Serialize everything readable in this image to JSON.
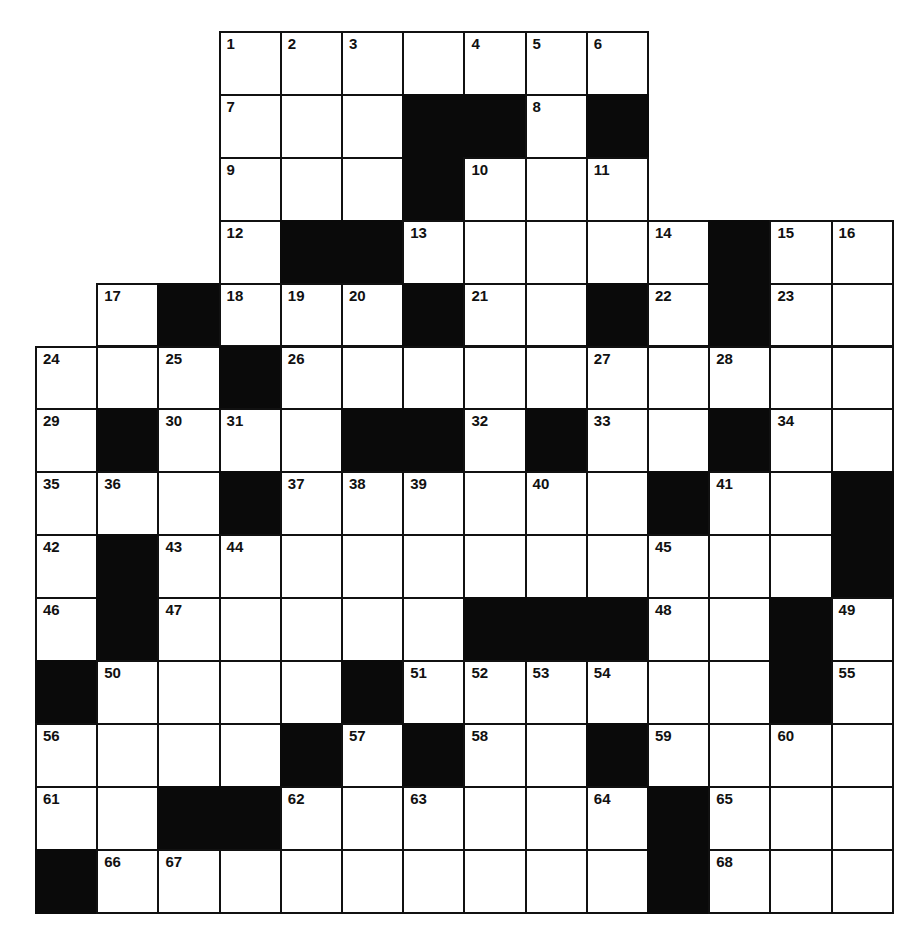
{
  "puzzle": {
    "type": "crossword",
    "grid_origin": {
      "left": 36,
      "top": 32
    },
    "cell_size": {
      "width": 61.2,
      "height": 62.9
    },
    "rows": 14,
    "cols": 14,
    "colors": {
      "block": "#0a0a0a",
      "line": "#111111",
      "cell": "#ffffff"
    },
    "legend": {
      "outside": ".",
      "block": "#",
      "empty": "_"
    },
    "grid": [
      [
        ".",
        ".",
        ".",
        "1",
        "2",
        "3",
        "_",
        "4",
        "5",
        "6",
        ".",
        ".",
        ".",
        "."
      ],
      [
        ".",
        ".",
        ".",
        "7",
        "_",
        "_",
        "#",
        "#",
        "8",
        "#",
        ".",
        ".",
        ".",
        "."
      ],
      [
        ".",
        ".",
        ".",
        "9",
        "_",
        "_",
        "#",
        "10",
        "_",
        "11",
        ".",
        ".",
        ".",
        "."
      ],
      [
        ".",
        ".",
        ".",
        "12",
        "#",
        "#",
        "13",
        "_",
        "_",
        "_",
        "14",
        "#",
        "15",
        "16"
      ],
      [
        ".",
        "17",
        "#",
        "18",
        "19",
        "20",
        "#",
        "21",
        "_",
        "#",
        "22",
        "#",
        "23",
        "_"
      ],
      [
        "24",
        "_",
        "25",
        "#",
        "26",
        "_",
        "_",
        "_",
        "_",
        "27",
        "_",
        "28",
        "_",
        "_"
      ],
      [
        "29",
        "#",
        "30",
        "31",
        "_",
        "#",
        "#",
        "32",
        "#",
        "33",
        "_",
        "#",
        "34",
        "_"
      ],
      [
        "35",
        "36",
        "_",
        "#",
        "37",
        "38",
        "39",
        "_",
        "40",
        "_",
        "#",
        "41",
        "_",
        "#"
      ],
      [
        "42",
        "#",
        "43",
        "44",
        "_",
        "_",
        "_",
        "_",
        "_",
        "_",
        "45",
        "_",
        "_",
        "#"
      ],
      [
        "46",
        "#",
        "47",
        "_",
        "_",
        "_",
        "_",
        "#",
        "#",
        "#",
        "48",
        "_",
        "#",
        "49"
      ],
      [
        "#",
        "50",
        "_",
        "_",
        "_",
        "#",
        "51",
        "52",
        "53",
        "54",
        "_",
        "_",
        "#",
        "55"
      ],
      [
        "56",
        "_",
        "_",
        "_",
        "#",
        "57",
        "#",
        "58",
        "_",
        "#",
        "59",
        "_",
        "60",
        "_"
      ],
      [
        "61",
        "_",
        "#",
        "#",
        "62",
        "_",
        "63",
        "_",
        "_",
        "64",
        "#",
        "65",
        "_",
        "_"
      ],
      [
        "#",
        "66",
        "67",
        "_",
        "_",
        "_",
        "_",
        "_",
        "_",
        "_",
        "#",
        "68",
        "_",
        "_"
      ]
    ],
    "entries": {}
  }
}
